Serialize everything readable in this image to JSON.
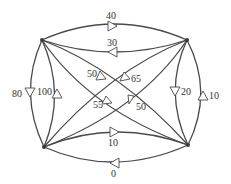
{
  "diagram": {
    "type": "directed-graph",
    "nodes": [
      {
        "id": "TL",
        "x": 42,
        "y": 40
      },
      {
        "id": "TR",
        "x": 187,
        "y": 40
      },
      {
        "id": "BL",
        "x": 44,
        "y": 147
      },
      {
        "id": "BR",
        "x": 188,
        "y": 145
      }
    ],
    "edges": [
      {
        "from": "TL",
        "to": "TR",
        "label": "40"
      },
      {
        "from": "TR",
        "to": "TL",
        "label": "30"
      },
      {
        "from": "TL",
        "to": "BL",
        "label": "80"
      },
      {
        "from": "BL",
        "to": "TL",
        "label": "100"
      },
      {
        "from": "TR",
        "to": "BR",
        "label": "20"
      },
      {
        "from": "BR",
        "to": "TR",
        "label": "10"
      },
      {
        "from": "BL",
        "to": "BR",
        "label": "10"
      },
      {
        "from": "BR",
        "to": "BL",
        "label": "0"
      },
      {
        "from": "TR",
        "to": "BL",
        "label": "50"
      },
      {
        "from": "TL",
        "to": "BR",
        "label": "65"
      },
      {
        "from": "BR",
        "to": "TL",
        "label": "55"
      },
      {
        "from": "BL",
        "to": "TR",
        "label": "50"
      }
    ]
  },
  "labels": {
    "top_outer": "40",
    "top_inner": "30",
    "left_outer": "80",
    "left_inner": "100",
    "right_inner": "20",
    "right_outer": "10",
    "bottom_inner": "10",
    "bottom_outer": "0",
    "diag_tr_bl": "50",
    "diag_tl_br": "65",
    "diag_br_tl": "55",
    "diag_bl_tr": "50"
  }
}
